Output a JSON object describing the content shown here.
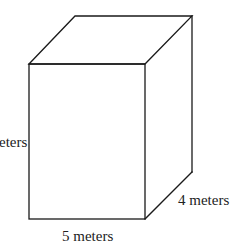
{
  "figure": {
    "type": "rectangular-prism",
    "labels": {
      "height": "eters",
      "width": "5 meters",
      "depth": "4 meters"
    },
    "colors": {
      "stroke": "#1a1a1a",
      "text": "#222222",
      "background": "#ffffff"
    }
  }
}
